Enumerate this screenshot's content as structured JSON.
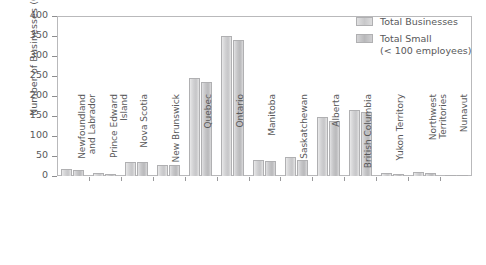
{
  "chart_data": {
    "type": "bar",
    "title": "",
    "xlabel": "",
    "ylabel": "Number of Businesses (000's)",
    "ylim": [
      0,
      400
    ],
    "yticks": [
      0,
      50,
      100,
      150,
      200,
      250,
      300,
      350,
      400
    ],
    "grid": false,
    "legend_position": "top-right",
    "categories": [
      "Newfoundland and Labrador",
      "Prince Edward Island",
      "Nova Scotia",
      "New Brunswick",
      "Quebec",
      "Ontario",
      "Manitoba",
      "Saskatchewan",
      "Alberta",
      "British Columbia",
      "Yukon Territory",
      "Northwest Territories",
      "Nunavut"
    ],
    "category_lines": [
      [
        "Newfoundland",
        "and Labrador"
      ],
      [
        "Prince Edward",
        "Island"
      ],
      [
        "Nova Scotia"
      ],
      [
        "New Brunswick"
      ],
      [
        "Quebec"
      ],
      [
        "Ontario"
      ],
      [
        "Manitoba"
      ],
      [
        "Saskatchewan"
      ],
      [
        "Alberta"
      ],
      [
        "British Columbia"
      ],
      [
        "Yukon Territory"
      ],
      [
        "Northwest",
        "Territories"
      ],
      [
        "Nunavut"
      ]
    ],
    "series": [
      {
        "name": "Total Businesses",
        "color": "#cfcfd1",
        "values": [
          17,
          7,
          36,
          28,
          245,
          350,
          39,
          47,
          147,
          165,
          7,
          9,
          2
        ]
      },
      {
        "name": "Total Small (< 100 employees)",
        "color": "#c0c0c2",
        "values": [
          16,
          6,
          35,
          27,
          235,
          340,
          38,
          40,
          138,
          160,
          6,
          8,
          2
        ]
      }
    ]
  },
  "legend": {
    "items": [
      {
        "label_line1": "Total Businesses",
        "label_line2": ""
      },
      {
        "label_line1": "Total Small",
        "label_line2": "(< 100 employees)"
      }
    ]
  },
  "axis": {
    "y_title": "Number of Businesses (000's)",
    "y_tick_labels": [
      "0",
      "50",
      "100",
      "150",
      "200",
      "250",
      "300",
      "350",
      "400"
    ]
  },
  "colors": {
    "series1": "#cfcfd1",
    "series2": "#c0c0c2",
    "axis": "#8e8e90",
    "text": "#58585a",
    "frame": "#b9b9bb",
    "background": "#ffffff"
  }
}
